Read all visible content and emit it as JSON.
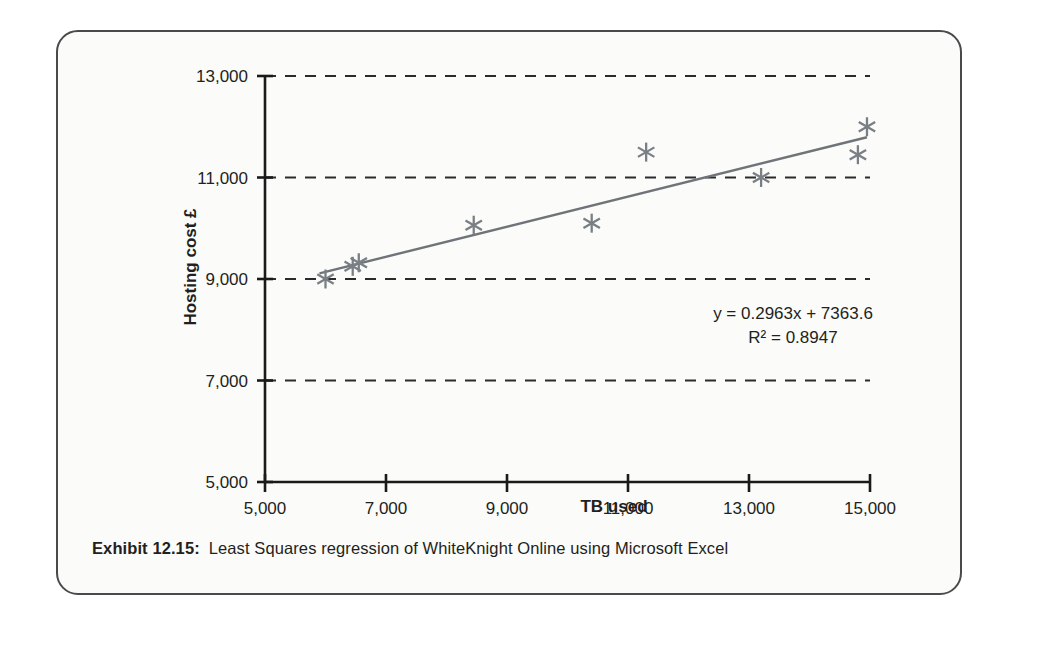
{
  "figure": {
    "caption_label": "Exhibit 12.15:",
    "caption_text": "Least Squares regression of WhiteKnight Online using Microsoft Excel"
  },
  "annotations": {
    "equation": "y = 0.2963x + 7363.6",
    "r_squared": "R² = 0.8947"
  },
  "colors": {
    "marker": "#7a7f85",
    "trendline": "#6f7479",
    "axis": "#1a1a1a",
    "gridline": "#2b2b2b",
    "card_border": "#4a4a4a",
    "background": "#fbfbfa",
    "text": "#231f20"
  },
  "chart_data": {
    "type": "scatter",
    "title": "",
    "xlabel": "TB used",
    "ylabel": "Hosting cost £",
    "xlim": [
      5000,
      15000
    ],
    "ylim": [
      5000,
      13000
    ],
    "xticks": [
      5000,
      7000,
      9000,
      11000,
      13000,
      15000
    ],
    "yticks": [
      5000,
      7000,
      9000,
      11000,
      13000
    ],
    "xtick_labels": [
      "5,000",
      "7,000",
      "9,000",
      "11,000",
      "13,000",
      "15,000"
    ],
    "ytick_labels": [
      "5,000",
      "7,000",
      "9,000",
      "11,000",
      "13,000"
    ],
    "grid": "horizontal-dashed",
    "legend": "none",
    "marker_style": "asterisk",
    "series": [
      {
        "name": "Hosting cost vs TB used",
        "x": [
          6000,
          6450,
          6550,
          8450,
          10400,
          11300,
          13200,
          14800,
          14950
        ],
        "y": [
          9000,
          9250,
          9320,
          10060,
          10100,
          11500,
          11000,
          11450,
          12000
        ]
      }
    ],
    "trendline": {
      "type": "linear-least-squares",
      "equation": "y = 0.2963x + 7363.6",
      "slope": 0.2963,
      "intercept": 7363.6,
      "r_squared": 0.8947,
      "x_start": 5900,
      "x_end": 14950
    }
  }
}
